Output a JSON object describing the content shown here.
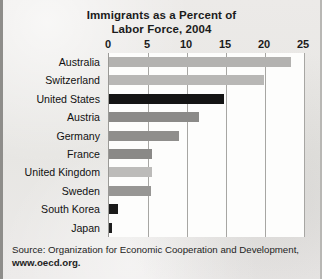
{
  "chart_data": {
    "type": "bar",
    "orientation": "horizontal",
    "title": "Immigrants as a Percent of Labor Force, 2004",
    "title_lines": [
      "Immigrants as a Percent of",
      "Labor Force, 2004"
    ],
    "xlabel": "",
    "ylabel": "",
    "xlim": [
      0,
      25
    ],
    "xticks": [
      0,
      5,
      10,
      15,
      20,
      25
    ],
    "xtick_labels": [
      "0",
      "5",
      "10",
      "15",
      "20",
      "25"
    ],
    "grid": "vertical",
    "legend": "none",
    "categories": [
      "Australia",
      "Switzerland",
      "United States",
      "Austria",
      "Germany",
      "France",
      "United Kingdom",
      "Sweden",
      "South Korea",
      "Japan"
    ],
    "values": [
      23.3,
      19.9,
      14.7,
      11.5,
      9.0,
      5.5,
      5.5,
      5.4,
      1.2,
      0.4
    ],
    "bar_colors": [
      "#b3b2b0",
      "#b8b7b5",
      "#141414",
      "#8b8a88",
      "#8f8e8c",
      "#8a8987",
      "#bcbbb9",
      "#979694",
      "#1a1a1a",
      "#1f1f1f"
    ],
    "source_lines": [
      "Source: Organization for Economic Cooperation and Development,",
      "www.oecd.org."
    ]
  },
  "colors": {
    "paper": "#e9e8e6",
    "plot_background": "#fdfdfc",
    "gridline": "#a7a6a3",
    "text": "#1b1b1b",
    "highlight_bar": "#141414"
  }
}
